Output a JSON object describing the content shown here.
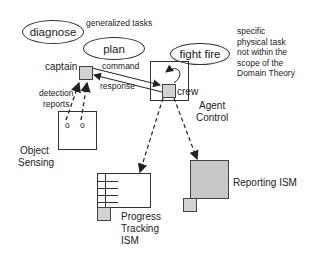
{
  "diagram": {
    "generalized_tasks": {
      "label": "generalized tasks",
      "items": [
        {
          "id": "diagnose",
          "label": "diagnose"
        },
        {
          "id": "plan",
          "label": "plan"
        }
      ]
    },
    "specific_task": {
      "label": "fight fire",
      "note_lines": [
        "specific",
        "physical task",
        "not within the",
        "scope of the",
        "Domain Theory"
      ]
    },
    "agents": {
      "captain": "captain",
      "crew": "crew"
    },
    "edges": {
      "command": "command",
      "response": "response",
      "detection_reports_lines": [
        "detection",
        "reports"
      ]
    },
    "components": {
      "agent_control_lines": [
        "Agent",
        "Control"
      ],
      "object_sensing_lines": [
        "Object",
        "Sensing"
      ],
      "progress_tracking_lines": [
        "Progress",
        "Tracking",
        "ISM"
      ],
      "reporting_ism": "Reporting ISM"
    },
    "sensor_glyph": "o"
  }
}
